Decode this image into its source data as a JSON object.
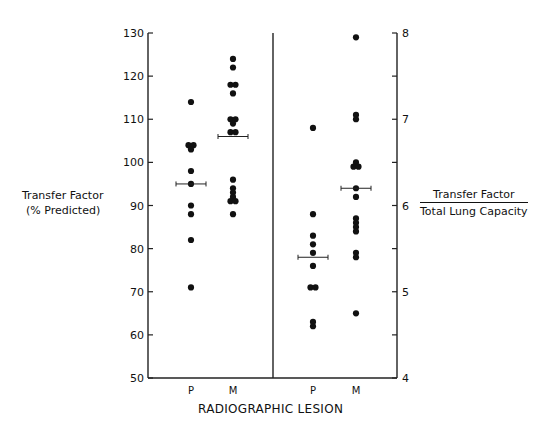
{
  "chart_data": {
    "type": "scatter",
    "title": "",
    "xlabel": "RADIOGRAPHIC LESION",
    "panels": [
      {
        "name": "left",
        "ylabel": "Transfer Factor (% Predicted)",
        "yaxis_side": "left",
        "ylim": [
          50,
          130
        ],
        "yticks": [
          50,
          60,
          70,
          80,
          90,
          100,
          110,
          120,
          130
        ],
        "categories": [
          "P",
          "M"
        ],
        "series": [
          {
            "name": "P",
            "values": [
              114,
              104,
              104,
              103,
              98,
              95,
              90,
              88,
              82,
              71
            ],
            "mean": 95
          },
          {
            "name": "M",
            "values": [
              124,
              122,
              118,
              118,
              116,
              110,
              110,
              109,
              107,
              107,
              96,
              94,
              93,
              92,
              91,
              91,
              88
            ],
            "mean": 106
          }
        ]
      },
      {
        "name": "right",
        "ylabel": "Transfer Factor / Total Lung Capacity",
        "ylabel_numerator": "Transfer Factor",
        "ylabel_denominator": "Total Lung Capacity",
        "yaxis_side": "right",
        "ylim": [
          4,
          8
        ],
        "yticks": [
          4,
          5,
          6,
          7,
          8
        ],
        "yminor_ticks": [
          4.5,
          5.5,
          6.5,
          7.5
        ],
        "categories": [
          "P",
          "M"
        ],
        "series": [
          {
            "name": "P",
            "values": [
              6.9,
              5.9,
              5.65,
              5.55,
              5.45,
              5.3,
              5.05,
              5.05,
              4.65,
              4.6
            ],
            "mean": 5.4
          },
          {
            "name": "M",
            "values": [
              7.95,
              7.05,
              7.0,
              6.5,
              6.45,
              6.45,
              6.2,
              6.1,
              5.85,
              5.8,
              5.75,
              5.7,
              5.45,
              5.4,
              4.75
            ],
            "mean": 6.2
          }
        ]
      }
    ],
    "grid": false,
    "legend": null
  },
  "labels": {
    "left_ylabel_line1": "Transfer Factor",
    "left_ylabel_line2": "(% Predicted)",
    "right_ylabel_num": "Transfer Factor",
    "right_ylabel_den": "Total Lung Capacity",
    "xlabel": "RADIOGRAPHIC LESION"
  }
}
